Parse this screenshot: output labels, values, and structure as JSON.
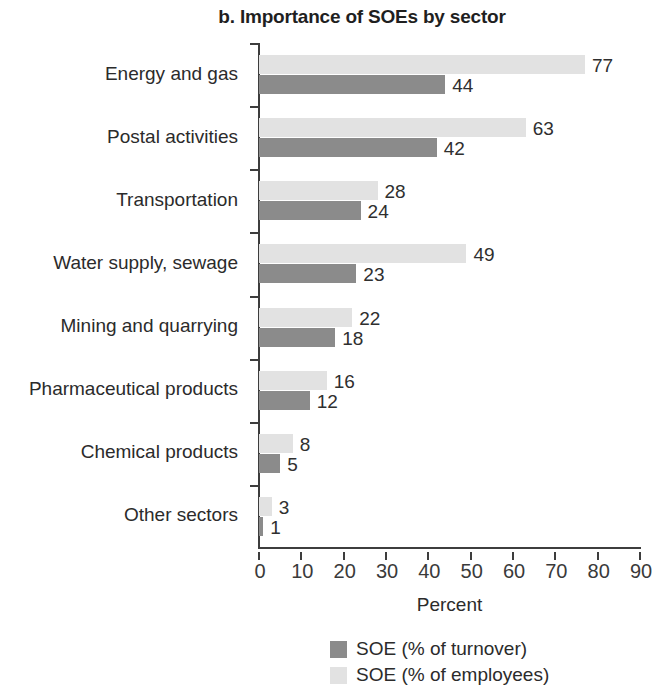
{
  "chart_data": {
    "type": "bar",
    "orientation": "horizontal",
    "title": "b. Importance of SOEs by sector",
    "xlabel": "Percent",
    "ylabel": "",
    "xlim": [
      0,
      90
    ],
    "xticks": [
      0,
      10,
      20,
      30,
      40,
      50,
      60,
      70,
      80,
      90
    ],
    "grid": false,
    "legend_position": "bottom",
    "categories": [
      "Energy and gas",
      "Postal activities",
      "Transportation",
      "Water supply, sewage",
      "Mining and quarrying",
      "Pharmaceutical products",
      "Chemical products",
      "Other sectors"
    ],
    "series": [
      {
        "name": "SOE (% of employees)",
        "color": "#e2e2e2",
        "values": [
          77,
          63,
          28,
          49,
          22,
          16,
          8,
          3
        ]
      },
      {
        "name": "SOE (% of turnover)",
        "color": "#8b8b8b",
        "values": [
          44,
          42,
          24,
          23,
          18,
          12,
          5,
          1
        ]
      }
    ]
  },
  "legend": {
    "items": [
      {
        "label": "SOE (% of turnover)",
        "color": "#8b8b8b"
      },
      {
        "label": "SOE (% of employees)",
        "color": "#e2e2e2"
      }
    ]
  }
}
